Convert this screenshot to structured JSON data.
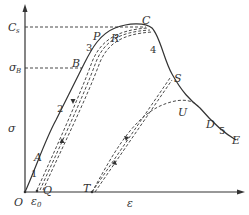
{
  "diagram": {
    "type": "stress-strain curve with unloading/reloading loops",
    "axes": {
      "y_label": "σ",
      "x_label": "ε",
      "origin_label": "O",
      "y_ticks": [
        {
          "label": "C",
          "sub": "s"
        },
        {
          "label": "σ",
          "sub": "B"
        }
      ],
      "x_ticks": [
        {
          "label": "ε",
          "sub": "0"
        }
      ]
    },
    "points": {
      "O": "O",
      "A": "A",
      "B": "B",
      "P": "P",
      "C": "C",
      "R": "R",
      "Q": "Q",
      "S": "S",
      "T": "T",
      "U": "U",
      "D": "D",
      "E": "E"
    },
    "segments": [
      "1",
      "2",
      "3",
      "4",
      "5"
    ],
    "colors": {
      "line": "#333333",
      "background": "#ffffff"
    }
  }
}
